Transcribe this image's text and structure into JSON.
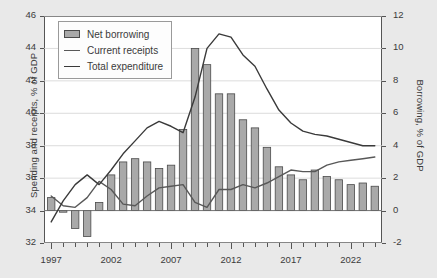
{
  "chart_data": {
    "type": "bar",
    "title": "",
    "xlabel": "",
    "ylabel": "Spending and receipts, % of GDP",
    "ylabel_secondary": "Borrowing, % of GDP",
    "ylim": [
      32,
      46
    ],
    "ylim_secondary": [
      -2,
      12
    ],
    "ytick_step": 2,
    "grid": true,
    "legend_position": "top-left",
    "x": [
      1997,
      1998,
      1999,
      2000,
      2001,
      2002,
      2003,
      2004,
      2005,
      2006,
      2007,
      2008,
      2009,
      2010,
      2011,
      2012,
      2013,
      2014,
      2015,
      2016,
      2017,
      2018,
      2019,
      2020,
      2021,
      2022,
      2023,
      2024
    ],
    "xtick_labels": [
      "1997",
      "2002",
      "2007",
      "2012",
      "2017",
      "2022"
    ],
    "xtick_values": [
      1997,
      2002,
      2007,
      2012,
      2017,
      2022
    ],
    "xlim": [
      1996.4,
      2024.6
    ],
    "series": [
      {
        "name": "Net borrowing",
        "type": "bar",
        "axis": "right",
        "unit": "% of GDP",
        "color": "#a9a9a9",
        "edge_color": "#4a4a4a",
        "values": [
          0.8,
          -0.1,
          -1.1,
          -1.6,
          0.5,
          2.2,
          3.0,
          3.2,
          3.0,
          2.6,
          2.8,
          5.0,
          10.0,
          9.0,
          7.2,
          7.2,
          5.6,
          5.1,
          3.9,
          2.7,
          2.2,
          1.9,
          2.5,
          2.1,
          1.9,
          1.6,
          1.7,
          1.5
        ]
      },
      {
        "name": "Current receipts",
        "type": "line",
        "axis": "left",
        "unit": "% of GDP",
        "color": "#585858",
        "values": [
          34.9,
          34.3,
          34.2,
          34.8,
          35.8,
          35.3,
          34.4,
          34.3,
          34.9,
          35.4,
          35.5,
          35.6,
          34.5,
          34.2,
          35.3,
          35.3,
          35.6,
          35.4,
          35.7,
          36.1,
          36.5,
          36.4,
          36.4,
          36.8,
          37.0,
          37.1,
          37.2,
          37.3
        ]
      },
      {
        "name": "Total expenditure",
        "type": "line",
        "axis": "left",
        "unit": "% of GDP",
        "color": "#3a3a3a",
        "values": [
          33.3,
          34.6,
          35.6,
          36.2,
          35.6,
          36.5,
          37.5,
          38.3,
          39.1,
          39.5,
          39.2,
          38.8,
          41.0,
          44.0,
          44.9,
          44.7,
          43.6,
          42.9,
          41.5,
          40.2,
          39.4,
          38.9,
          38.7,
          38.6,
          38.4,
          38.2,
          38.0,
          38.0
        ]
      }
    ]
  },
  "legend": {
    "items": [
      {
        "label": "Net borrowing",
        "marker": "bar-swatch"
      },
      {
        "label": "Current receipts",
        "marker": "line-swatch"
      },
      {
        "label": "Total expenditure",
        "marker": "line-swatch-dark"
      }
    ]
  },
  "axes": {
    "left_title": "Spending and receipts, % of GDP",
    "right_title": "Borrowing, % of GDP",
    "left_ticks": [
      "46",
      "44",
      "42",
      "40",
      "38",
      "36",
      "34",
      "32"
    ],
    "right_ticks": [
      "12",
      "10",
      "8",
      "6",
      "4",
      "2",
      "0",
      "-2"
    ]
  }
}
